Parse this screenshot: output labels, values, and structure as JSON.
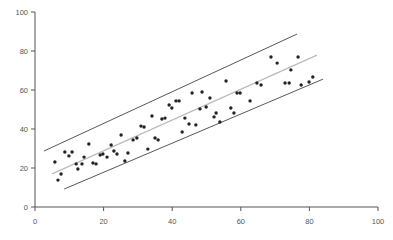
{
  "chart_data": {
    "type": "scatter",
    "title": "",
    "xlabel": "",
    "ylabel": "",
    "xlim": [
      0,
      100
    ],
    "ylim": [
      0,
      100
    ],
    "xticks": [
      0,
      20,
      40,
      60,
      80,
      100
    ],
    "yticks": [
      0,
      20,
      40,
      60,
      80,
      100
    ],
    "grid": false,
    "legend": null,
    "colors": {
      "points": "#222222",
      "fit_line": "#bbbbbb",
      "band_lines": "#444444",
      "axis": "#555555"
    },
    "series": [
      {
        "name": "points",
        "points": [
          [
            5.8,
            23.1
          ],
          [
            6.7,
            13.8
          ],
          [
            7.6,
            16.9
          ],
          [
            8.7,
            28.2
          ],
          [
            9.9,
            26.2
          ],
          [
            10.8,
            28.2
          ],
          [
            12.0,
            22.1
          ],
          [
            12.5,
            19.5
          ],
          [
            13.7,
            22.1
          ],
          [
            14.3,
            25.6
          ],
          [
            15.7,
            32.3
          ],
          [
            16.9,
            22.6
          ],
          [
            17.8,
            22.1
          ],
          [
            19.0,
            26.7
          ],
          [
            19.8,
            27.2
          ],
          [
            21.0,
            25.6
          ],
          [
            22.2,
            31.8
          ],
          [
            23.0,
            28.7
          ],
          [
            23.9,
            27.2
          ],
          [
            25.1,
            36.9
          ],
          [
            26.2,
            23.6
          ],
          [
            27.1,
            27.7
          ],
          [
            28.6,
            34.4
          ],
          [
            29.7,
            35.4
          ],
          [
            30.9,
            41.5
          ],
          [
            31.8,
            41.0
          ],
          [
            32.9,
            29.7
          ],
          [
            34.1,
            46.7
          ],
          [
            35.0,
            35.4
          ],
          [
            35.9,
            34.4
          ],
          [
            37.0,
            45.1
          ],
          [
            37.9,
            45.6
          ],
          [
            39.1,
            52.3
          ],
          [
            39.9,
            50.8
          ],
          [
            41.1,
            54.4
          ],
          [
            42.0,
            54.4
          ],
          [
            42.9,
            38.5
          ],
          [
            43.7,
            45.6
          ],
          [
            44.9,
            42.6
          ],
          [
            45.8,
            58.5
          ],
          [
            46.9,
            42.1
          ],
          [
            48.1,
            50.3
          ],
          [
            48.7,
            59.0
          ],
          [
            49.9,
            51.3
          ],
          [
            51.0,
            55.9
          ],
          [
            52.2,
            46.2
          ],
          [
            52.8,
            48.2
          ],
          [
            53.9,
            43.6
          ],
          [
            55.7,
            64.6
          ],
          [
            57.1,
            50.8
          ],
          [
            58.0,
            48.2
          ],
          [
            58.9,
            58.5
          ],
          [
            59.8,
            58.5
          ],
          [
            62.7,
            54.4
          ],
          [
            64.7,
            63.6
          ],
          [
            65.9,
            62.6
          ],
          [
            68.8,
            76.9
          ],
          [
            70.6,
            73.8
          ],
          [
            72.9,
            63.6
          ],
          [
            74.1,
            63.6
          ],
          [
            74.6,
            70.3
          ],
          [
            76.7,
            76.9
          ],
          [
            77.6,
            62.6
          ],
          [
            79.9,
            64.1
          ],
          [
            81.0,
            66.7
          ]
        ]
      }
    ],
    "lines": [
      {
        "name": "fit",
        "from": [
          5.0,
          17.0
        ],
        "to": [
          82.2,
          77.9
        ]
      },
      {
        "name": "upper-band",
        "from": [
          2.6,
          28.7
        ],
        "to": [
          76.4,
          88.7
        ]
      },
      {
        "name": "lower-band",
        "from": [
          8.5,
          9.2
        ],
        "to": [
          84.0,
          65.6
        ]
      }
    ]
  }
}
